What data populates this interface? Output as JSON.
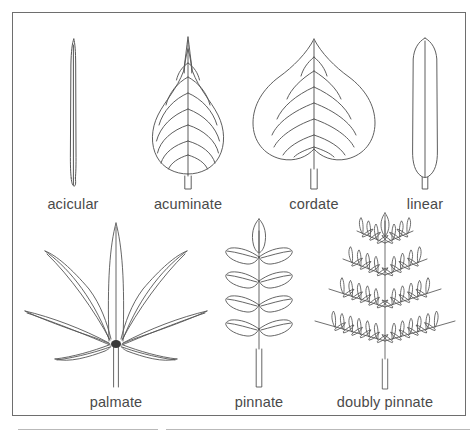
{
  "figure": {
    "border_color": "#6e6e6e",
    "background_color": "#ffffff",
    "stroke_color": "#555555",
    "label_color": "#4a4a4a",
    "rows": [
      {
        "row": 1,
        "items": [
          {
            "label": "acicular",
            "icon": "acicular-leaf-icon",
            "description": "needle-like, very narrow elongated leaf"
          },
          {
            "label": "acuminate",
            "icon": "acuminate-leaf-icon",
            "description": "broad leaf tapering to a long drawn-out point with arching veins"
          },
          {
            "label": "cordate",
            "icon": "cordate-leaf-icon",
            "description": "heart-shaped leaf with notched base and pointed tip"
          },
          {
            "label": "linear",
            "icon": "linear-leaf-icon",
            "description": "long narrow strap-shaped leaf with parallel sides"
          }
        ]
      },
      {
        "row": 2,
        "items": [
          {
            "label": "palmate",
            "icon": "palmate-leaf-icon",
            "description": "seven narrow leaflets radiating from a single point"
          },
          {
            "label": "pinnate",
            "icon": "pinnate-leaf-icon",
            "description": "leaflets in four opposite pairs along a rachis plus a terminal leaflet"
          },
          {
            "label": "doubly pinnate",
            "icon": "doubly-pinnate-leaf-icon",
            "description": "pinnae themselves divided into leaflets, triangular outline"
          }
        ]
      }
    ],
    "rules": [
      {
        "name": "footer-rule-left"
      },
      {
        "name": "footer-rule-right"
      }
    ]
  }
}
